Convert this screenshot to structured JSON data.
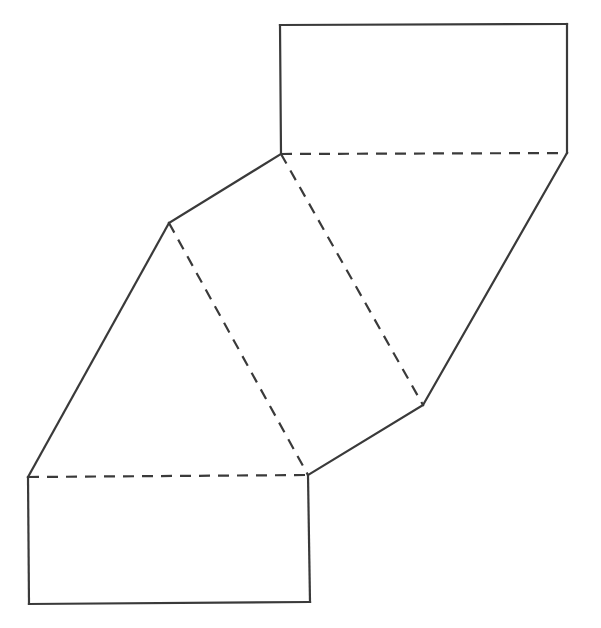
{
  "diagram": {
    "type": "net of triangular prism",
    "stroke_color": "#3a3a3a",
    "background": "#ffffff",
    "vertices": {
      "A": [
        280,
        25
      ],
      "B": [
        567,
        24
      ],
      "C": [
        567,
        153
      ],
      "D": [
        281,
        154
      ],
      "E": [
        169,
        223
      ],
      "F": [
        423,
        405
      ],
      "G": [
        28,
        477
      ],
      "H": [
        308,
        475
      ],
      "I": [
        310,
        602
      ],
      "J": [
        29,
        604
      ]
    },
    "solid_edges": [
      [
        "D",
        "A"
      ],
      [
        "A",
        "B"
      ],
      [
        "B",
        "C"
      ],
      [
        "C",
        "F"
      ],
      [
        "F",
        "H"
      ],
      [
        "H",
        "I"
      ],
      [
        "I",
        "J"
      ],
      [
        "J",
        "G"
      ],
      [
        "G",
        "E"
      ],
      [
        "E",
        "D"
      ]
    ],
    "fold_lines": [
      [
        "D",
        "C"
      ],
      [
        "D",
        "F"
      ],
      [
        "E",
        "H"
      ],
      [
        "G",
        "H"
      ]
    ]
  }
}
